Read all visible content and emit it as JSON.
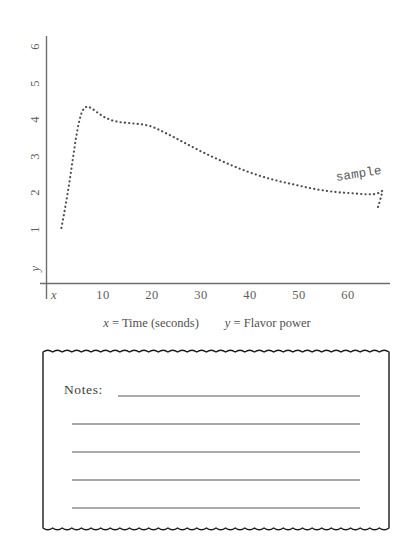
{
  "chart_data": {
    "type": "line",
    "title": "",
    "subtitle": "",
    "xlabel": "x = Time (seconds)",
    "ylabel": "y = Flavor power",
    "x_axis_symbol": "x",
    "y_axis_symbol": "y",
    "xlim": [
      0,
      70
    ],
    "ylim": [
      0,
      6.5
    ],
    "xticks": [
      10,
      20,
      30,
      40,
      50,
      60
    ],
    "xtick_labels": [
      "10",
      "20",
      "30",
      "40",
      "50",
      "60"
    ],
    "yticks": [
      1,
      2,
      3,
      4,
      5,
      6
    ],
    "ytick_labels": [
      "1",
      "2",
      "3",
      "4",
      "5",
      "6"
    ],
    "grid": false,
    "legend": "none",
    "line_style": "dotted",
    "line_color": "#4d4d4d",
    "annotations": [
      {
        "text": "sample",
        "x": 58,
        "y": 2.35,
        "rotation": -9
      }
    ],
    "series": [
      {
        "name": "sample",
        "x": [
          1.5,
          2.0,
          2.6,
          3.2,
          3.8,
          4.4,
          5.0,
          5.6,
          6.2,
          7.0,
          8.0,
          9.2,
          10.5,
          12.0,
          13.5,
          15.0,
          16.5,
          18.0,
          19.5,
          21.0,
          22.5,
          24.0,
          26.0,
          28.0,
          30.0,
          32.0,
          34.0,
          36.0,
          38.0,
          40.0,
          42.0,
          44.0,
          46.0,
          48.0,
          50.0,
          52.0,
          54.0,
          56.0,
          58.0,
          60.0,
          62.0,
          64.0,
          65.5,
          66.5,
          67.0,
          66.8,
          66.4,
          66.0
        ],
        "y": [
          1.0,
          1.35,
          1.8,
          2.3,
          2.85,
          3.4,
          3.85,
          4.15,
          4.3,
          4.33,
          4.25,
          4.13,
          4.02,
          3.94,
          3.9,
          3.88,
          3.86,
          3.84,
          3.8,
          3.72,
          3.62,
          3.52,
          3.38,
          3.24,
          3.1,
          2.97,
          2.85,
          2.73,
          2.62,
          2.52,
          2.43,
          2.35,
          2.28,
          2.22,
          2.16,
          2.1,
          2.05,
          2.01,
          1.98,
          1.96,
          1.94,
          1.92,
          1.93,
          1.97,
          2.02,
          1.88,
          1.7,
          1.52
        ]
      }
    ]
  },
  "caption": {
    "x_part_symbol": "x",
    "x_part_text": " = Time (seconds)",
    "y_part_symbol": "y",
    "y_part_text": " = Flavor power"
  },
  "notes": {
    "label": "Notes:",
    "line_count": 5,
    "edge_style": "wavy",
    "border_color": "#1a1a1a",
    "rule_color": "#555555"
  }
}
